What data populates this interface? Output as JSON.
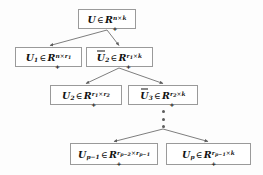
{
  "figure": {
    "type": "tree-diagram",
    "background_color": "#fdfdfd",
    "node_border_color": "#9a9a9a",
    "edge_color": "#5d5d5d",
    "text_color": "#121212"
  },
  "nodes": [
    {
      "id": "root",
      "label": "U ∈ R₊^{n×k}",
      "base": "U",
      "overline": false,
      "subscript": "",
      "set": "R",
      "set_subscript": "+",
      "rows": "n",
      "cols": "k",
      "exponent": "n×k",
      "level": 0,
      "x": 78,
      "y": 9,
      "w": 58,
      "h": 20
    },
    {
      "id": "u1",
      "label": "U₁ ∈ R₊^{n×r₁}",
      "base": "U",
      "overline": false,
      "subscript": "1",
      "set": "R",
      "set_subscript": "+",
      "rows": "n",
      "cols": "r₁",
      "exponent": "n×r1",
      "level": 1,
      "x": 15,
      "y": 47,
      "w": 67,
      "h": 20
    },
    {
      "id": "u2bar",
      "label": "Ū₂ ∈ R₊^{r₁×k}",
      "base": "U",
      "overline": true,
      "subscript": "2",
      "set": "R",
      "set_subscript": "+",
      "rows": "r₁",
      "cols": "k",
      "exponent": "r1×k",
      "level": 1,
      "x": 86,
      "y": 47,
      "w": 67,
      "h": 20
    },
    {
      "id": "u2",
      "label": "U₂ ∈ R₊^{r₁×r₂}",
      "base": "U",
      "overline": false,
      "subscript": "2",
      "set": "R",
      "set_subscript": "+",
      "rows": "r₁",
      "cols": "r₂",
      "exponent": "r1×r2",
      "level": 2,
      "x": 50,
      "y": 85,
      "w": 72,
      "h": 20
    },
    {
      "id": "u3bar",
      "label": "Ū₃ ∈ R₊^{r₂×k}",
      "base": "U",
      "overline": true,
      "subscript": "3",
      "set": "R",
      "set_subscript": "+",
      "rows": "r₂",
      "cols": "k",
      "exponent": "r2×k",
      "level": 2,
      "x": 128,
      "y": 85,
      "w": 70,
      "h": 20
    },
    {
      "id": "up1",
      "label": "U_{p−1} ∈ R₊^{r_{p−2}×r_{p−1}}",
      "base": "U",
      "overline": false,
      "subscript": "p−1",
      "set": "R",
      "set_subscript": "+",
      "rows": "r_{p−2}",
      "cols": "r_{p−1}",
      "exponent": "rp-2×rp-1",
      "level": 3,
      "x": 70,
      "y": 143,
      "w": 88,
      "h": 22
    },
    {
      "id": "up",
      "label": "U_p ∈ R₊^{r_{p−1}×k}",
      "base": "U",
      "overline": false,
      "subscript": "p",
      "set": "R",
      "set_subscript": "+",
      "rows": "r_{p−1}",
      "cols": "k",
      "exponent": "rp-1×k",
      "level": 3,
      "x": 166,
      "y": 143,
      "w": 85,
      "h": 22
    }
  ],
  "ellipsis": {
    "name": "vertical-ellipsis",
    "dot_count": 3,
    "x": 161,
    "y": 110,
    "w": 5,
    "h": 18
  },
  "edges": [
    {
      "from": "root",
      "to": "u1",
      "label": ""
    },
    {
      "from": "root",
      "to": "u2bar",
      "label": ""
    },
    {
      "from": "u2bar",
      "to": "u2",
      "label": ""
    },
    {
      "from": "u2bar",
      "to": "u3bar",
      "label": ""
    },
    {
      "from": "ellipsis",
      "to": "up1",
      "label": ""
    },
    {
      "from": "ellipsis",
      "to": "up",
      "label": ""
    }
  ],
  "symbols": {
    "element_of": "∈",
    "times": "×",
    "minus": "−",
    "plus": "+"
  }
}
